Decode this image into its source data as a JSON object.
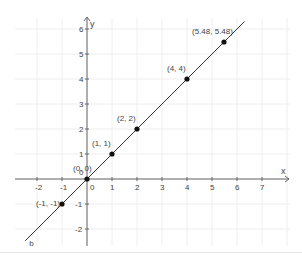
{
  "graph": {
    "x_axis_label": "x",
    "y_axis_label": "y",
    "line_label": "b",
    "x_ticks": [
      "-2",
      "-1",
      "0",
      "1",
      "2",
      "3",
      "4",
      "5",
      "6",
      "7"
    ],
    "y_ticks": [
      "-2",
      "-1",
      "1",
      "2",
      "3",
      "4",
      "5",
      "6"
    ],
    "origin_label": "0",
    "points": [
      {
        "label": "(-1, -1)",
        "x": -1,
        "y": -1
      },
      {
        "label": "(0, 0)",
        "x": 0,
        "y": 0
      },
      {
        "label": "(1, 1)",
        "x": 1,
        "y": 1
      },
      {
        "label": "(2, 2)",
        "x": 2,
        "y": 2
      },
      {
        "label": "(4, 4)",
        "x": 4,
        "y": 4
      },
      {
        "label": "(5.48, 5.48)",
        "x": 5.48,
        "y": 5.48
      }
    ],
    "colors": {
      "axis": "#666666",
      "grid": "#eeeeee",
      "line": "#333333",
      "point": "#111111",
      "text": "#444444"
    }
  }
}
